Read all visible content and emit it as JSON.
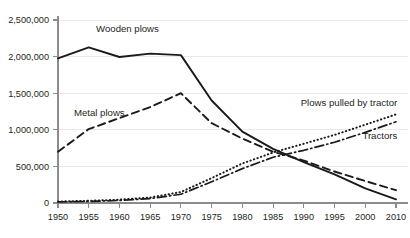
{
  "chart_data": {
    "type": "line",
    "title": "",
    "subtitle": "",
    "xlabel": "",
    "ylabel": "",
    "grid": "horizontal",
    "legend_position": "inline-labels",
    "x": [
      1950,
      1955,
      1960,
      1965,
      1970,
      1975,
      1980,
      1985,
      1990,
      1995,
      2000,
      2010
    ],
    "xtick_labels": [
      "1950",
      "1955",
      "1960",
      "1965",
      "1970",
      "1975",
      "1980",
      "1985",
      "1990",
      "1995",
      "2000",
      "2010"
    ],
    "ytick_labels": [
      "0",
      "500,000",
      "1,000,000",
      "1,500,000",
      "2,000,000",
      "2,500,000"
    ],
    "ytick_values": [
      0,
      500000,
      1000000,
      1500000,
      2000000,
      2500000
    ],
    "ylim": [
      0,
      2500000
    ],
    "series": [
      {
        "name": "Wooden plows",
        "style": "solid",
        "label": "Wooden plows",
        "label_x": 1956.2,
        "label_y": 2330000,
        "label_anchor": "start",
        "values": [
          1975000,
          2125000,
          1995000,
          2040000,
          2020000,
          1400000,
          975000,
          740000,
          560000,
          390000,
          200000,
          50000
        ]
      },
      {
        "name": "Metal plows",
        "style": "dashed",
        "label": "Metal plows",
        "label_x": 1952.6,
        "label_y": 1185000,
        "label_anchor": "start",
        "values": [
          700000,
          1010000,
          1160000,
          1310000,
          1500000,
          1090000,
          880000,
          700000,
          580000,
          430000,
          300000,
          175000
        ]
      },
      {
        "name": "Plows pulled by tractor",
        "style": "dotted",
        "label": "Plows pulled by tractor",
        "label_x": 2010.4,
        "label_y": 1320000,
        "label_anchor": "end",
        "values": [
          20000,
          30000,
          45000,
          75000,
          150000,
          340000,
          540000,
          690000,
          810000,
          930000,
          1070000,
          1210000
        ]
      },
      {
        "name": "Tractors",
        "style": "dashdot",
        "label": "Tractors",
        "label_x": 2010.4,
        "label_y": 880000,
        "label_anchor": "end",
        "values": [
          15000,
          22000,
          35000,
          60000,
          120000,
          290000,
          470000,
          625000,
          720000,
          830000,
          965000,
          1110000
        ]
      }
    ]
  }
}
